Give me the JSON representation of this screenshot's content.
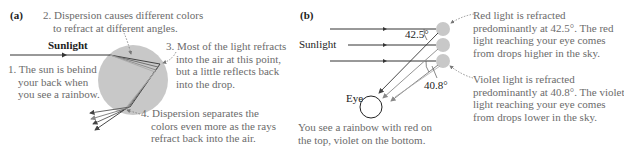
{
  "panel_a": {
    "label": "(a)",
    "sunlight_label": "Sunlight",
    "notes": [
      {
        "num": "1.",
        "lines": [
          "1. The sun is behind",
          "your back when",
          "you see a rainbow."
        ]
      },
      {
        "num": "2.",
        "lines": [
          "2. Dispersion causes different colors",
          "to refract at different angles."
        ]
      },
      {
        "num": "3.",
        "lines": [
          "3. Most of the light refracts",
          "into the air at this point,",
          "but a little reflects back",
          "into the drop."
        ]
      },
      {
        "num": "4.",
        "lines": [
          "4. Dispersion separates the",
          "colors even more as the rays",
          "refract back into the air."
        ]
      }
    ]
  },
  "panel_b": {
    "label": "(b)",
    "sunlight_label": "Sunlight",
    "angle_red": "42.5°",
    "angle_violet": "40.8°",
    "eye_label": "Eye",
    "caption": [
      "You see a rainbow with red on",
      "the top, violet on the bottom."
    ],
    "red_note": [
      "Red light is refracted",
      "predominantly at 42.5°. The red",
      "light reaching your eye comes",
      "from drops higher in the sky."
    ],
    "violet_note": [
      "Violet light is refracted",
      "predominantly at 40.8°. The violet",
      "light reaching your eye comes",
      "from drops lower in the sky."
    ]
  },
  "colors": {
    "drop_fill": "#c8c8c8",
    "ray": "#444444",
    "annotation_text": "#6b6b6b"
  }
}
